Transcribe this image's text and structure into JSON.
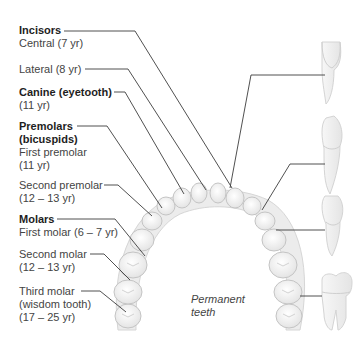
{
  "diagram": {
    "title": "Permanent teeth",
    "caption_lines": [
      "Permanent",
      "teeth"
    ],
    "labels": [
      {
        "id": "incisors",
        "heading": "Incisors",
        "lines": [
          "Central (7 yr)"
        ],
        "top": 24
      },
      {
        "id": "lateral",
        "heading": "",
        "lines": [
          "Lateral (8 yr)"
        ],
        "top": 63
      },
      {
        "id": "canine",
        "heading": "Canine (eyetooth)",
        "lines": [
          "(11 yr)"
        ],
        "top": 86
      },
      {
        "id": "premolars",
        "heading": "Premolars",
        "heading2": "(bicuspids)",
        "lines": [
          "First premolar",
          "(11 yr)"
        ],
        "top": 120
      },
      {
        "id": "second-premolar",
        "heading": "",
        "lines": [
          "Second premolar",
          "(12 – 13 yr)"
        ],
        "top": 179
      },
      {
        "id": "molars",
        "heading": "Molars",
        "lines": [
          "First molar (6 – 7 yr)"
        ],
        "top": 213
      },
      {
        "id": "second-molar",
        "heading": "",
        "lines": [
          "Second molar",
          "(12 – 13 yr)"
        ],
        "top": 248
      },
      {
        "id": "third-molar",
        "heading": "",
        "lines": [
          "Third molar",
          "(wisdom tooth)",
          "(17 – 25 yr)"
        ],
        "top": 285
      }
    ],
    "side_teeth": [
      "incisor",
      "canine",
      "premolar",
      "molar"
    ],
    "colors": {
      "line": "#3c3c3c",
      "tooth_outline": "#c8c8c8",
      "tooth_fill": "#f4f4f4",
      "gum": "#e6e6e6"
    }
  }
}
